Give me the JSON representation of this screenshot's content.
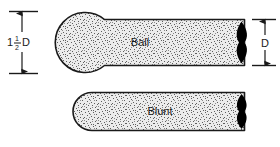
{
  "figure": {
    "type": "technical-illustration",
    "title": "",
    "background_color": "#ffffff",
    "outline_color": "#1a1a1a",
    "fill_color": "#e8e8e8",
    "stipple_color": "#5a5a5a",
    "tip_color": "#000000"
  },
  "dimensions": {
    "left": {
      "label_whole": "1",
      "label_numerator": "1",
      "label_denominator": "2",
      "label_symbol": "D",
      "label_full": "1 1/2 D",
      "orientation": "vertical",
      "measures": "ball-diameter"
    },
    "right": {
      "label": "D",
      "orientation": "vertical",
      "measures": "shaft-diameter"
    }
  },
  "parts": [
    {
      "id": "ball",
      "label": "Ball",
      "tip_style": "spherical-ball-end",
      "description": "Shaft with enlarged spherical ball at left end"
    },
    {
      "id": "blunt",
      "label": "Blunt",
      "tip_style": "rounded-blunt-end",
      "description": "Shaft with rounded blunt left end of equal diameter"
    }
  ]
}
